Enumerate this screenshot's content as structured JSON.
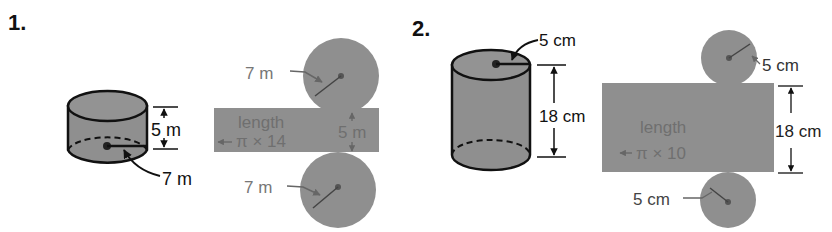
{
  "colors": {
    "fill": "#8f8f8f",
    "fill_light": "#9a9a9a",
    "stroke": "#111111",
    "net_text": "#6f6f6f",
    "label": "#111111",
    "faint_label": "#777777"
  },
  "problems": [
    {
      "number": "1.",
      "solid": {
        "type": "cylinder",
        "height_label": "5 m",
        "radius_label": "7 m"
      },
      "net": {
        "top_circle_label": "7 m",
        "bottom_circle_label": "7 m",
        "rect_text_line1": "length",
        "rect_text_line2": "π × 14",
        "rect_height_label": "5 m"
      }
    },
    {
      "number": "2.",
      "solid": {
        "type": "cylinder",
        "height_label": "18 cm",
        "radius_label": "5 cm"
      },
      "net": {
        "top_circle_label": "5 cm",
        "bottom_circle_label": "5 cm",
        "rect_text_line1": "length",
        "rect_text_line2": "π × 10",
        "rect_height_label": "18 cm"
      }
    }
  ]
}
